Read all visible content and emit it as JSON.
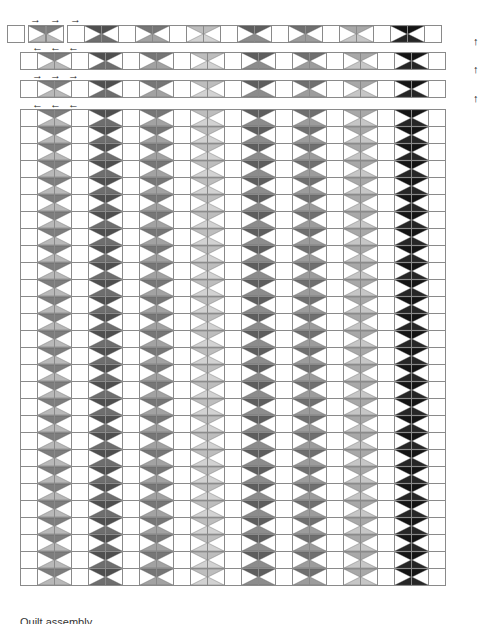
{
  "diagram": {
    "caption": "Quilt assembly",
    "grid_cols": 25,
    "grid_rows": 28,
    "cell_px": 18,
    "block_period_cells": 3,
    "block_columns": [
      {
        "index": 1,
        "top": "#7d7d7d",
        "bottom": "#b8b8b8"
      },
      {
        "index": 2,
        "top": "#4f4f4f",
        "bottom": "#6e6e6e"
      },
      {
        "index": 3,
        "top": "#767676",
        "bottom": "#a2a2a2"
      },
      {
        "index": 4,
        "top": "#bdbdbd",
        "bottom": "#d2d2d2"
      },
      {
        "index": 5,
        "top": "#5e5e5e",
        "bottom": "#8c8c8c"
      },
      {
        "index": 6,
        "top": "#6f6f6f",
        "bottom": "#9c9c9c"
      },
      {
        "index": 7,
        "top": "#a8a8a8",
        "bottom": "#c6c6c6"
      },
      {
        "index": 8,
        "top": "#141414",
        "bottom": "#262626"
      }
    ],
    "assembly_rows": [
      {
        "label": "row-1",
        "arrows": "right",
        "offset_x": 7
      },
      {
        "label": "row-2",
        "arrows": "left",
        "offset_x": 20
      },
      {
        "label": "row-3",
        "arrows": "right",
        "offset_x": 20
      }
    ],
    "press_direction_icons": {
      "right": "→",
      "left": "←",
      "up": "↑"
    }
  }
}
